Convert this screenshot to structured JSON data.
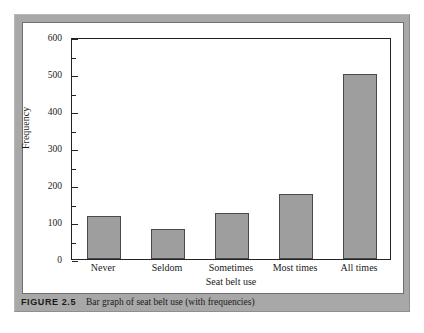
{
  "figure": {
    "caption_label": "FIGURE 2.5",
    "caption_text": "Bar graph of seat belt use (with frequencies)"
  },
  "colors": {
    "frame": "#a8a8a8",
    "panel": "#ffffff",
    "bar_fill": "#9e9e9e",
    "bar_stroke": "#4a4a4a",
    "axis": "#222222",
    "text": "#1a1a1a"
  },
  "chart_data": {
    "type": "bar",
    "title": "",
    "subtitle": "",
    "xlabel": "Seat belt use",
    "ylabel": "Frequency",
    "categories": [
      "Never",
      "Seldom",
      "Sometimes",
      "Most times",
      "All times"
    ],
    "values": [
      115,
      80,
      125,
      177,
      499
    ],
    "ylim": [
      0,
      600
    ],
    "ytick_labels": [
      "0",
      "100",
      "200",
      "300",
      "400",
      "500",
      "600"
    ],
    "ytick_values": [
      0,
      100,
      200,
      300,
      400,
      500,
      600
    ],
    "yminor_tick_values": [
      50,
      150,
      250,
      350,
      450,
      550
    ],
    "grid": false,
    "legend": null,
    "annotations": []
  }
}
